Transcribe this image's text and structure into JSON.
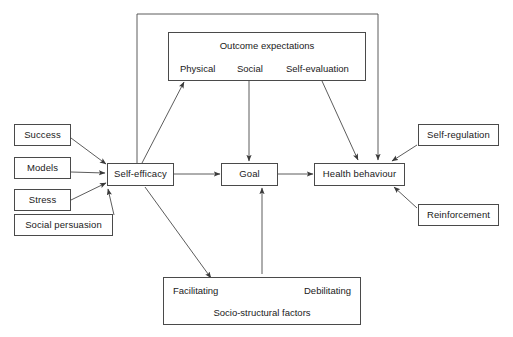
{
  "diagram": {
    "stroke_color": "#4a4a4a",
    "text_color": "#1a1a1a",
    "background": "#ffffff"
  },
  "sources": {
    "success": "Success",
    "models": "Models",
    "stress": "Stress",
    "social_persuasion": "Social persuasion"
  },
  "core": {
    "self_efficacy": "Self-efficacy",
    "goal": "Goal",
    "health_behaviour": "Health behaviour"
  },
  "outcome_expectations": {
    "title": "Outcome expectations",
    "physical": "Physical",
    "social": "Social",
    "self_evaluation": "Self-evaluation"
  },
  "socio_structural": {
    "facilitating": "Facilitating",
    "debilitating": "Debilitating",
    "title": "Socio-structural factors"
  },
  "moderators": {
    "self_regulation": "Self-regulation",
    "reinforcement": "Reinforcement"
  }
}
